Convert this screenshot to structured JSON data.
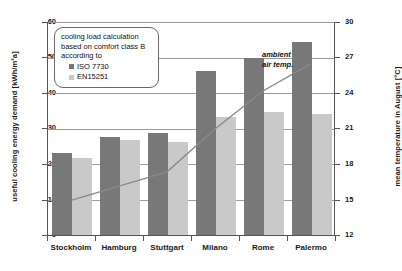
{
  "chart_data": {
    "type": "bar",
    "title": "",
    "categories": [
      "Stockholm",
      "Hamburg",
      "Stuttgart",
      "Milano",
      "Rome",
      "Palermo"
    ],
    "series": [
      {
        "name": "ISO 7730",
        "type": "bar",
        "color": "#787878",
        "axis": "left",
        "values": [
          23.0,
          27.5,
          28.5,
          46.0,
          49.5,
          54.0
        ]
      },
      {
        "name": "EN15251",
        "type": "bar",
        "color": "#c9c9c9",
        "axis": "left",
        "values": [
          21.5,
          26.5,
          26.0,
          33.0,
          34.5,
          34.0
        ]
      },
      {
        "name": "ambient air temp.",
        "type": "line",
        "color": "#8a8a8a",
        "axis": "right",
        "values": [
          15.0,
          16.2,
          17.4,
          21.0,
          24.2,
          26.5
        ]
      }
    ],
    "xlabel": "",
    "ylabel": "useful cooling energy demand [kWh/m²a]",
    "ylabel_right": "mean temperature in August [°C]",
    "ylim": [
      0,
      60
    ],
    "yticks": [
      "0",
      "10",
      "20",
      "30",
      "40",
      "50",
      "60"
    ],
    "ylim_right": [
      12,
      30
    ],
    "yticks_right": [
      "12",
      "15",
      "18",
      "21",
      "24",
      "27",
      "30"
    ],
    "grid": true,
    "legend_position": "upper-left"
  },
  "axes": {
    "left_title": "useful cooling energy demand [kWh/m²a]",
    "right_title": "mean temperature in August [°C]"
  },
  "legend": {
    "heading_line1": "cooling load calculation",
    "heading_line2": "based on comfort class B",
    "heading_line3": "according to",
    "items": [
      {
        "label": "ISO 7730"
      },
      {
        "label": "EN15251"
      }
    ]
  },
  "annotations": {
    "ambient_line1": "ambient",
    "ambient_line2": "air temp."
  },
  "colors": {
    "series1": "#787878",
    "series2": "#c9c9c9",
    "line": "#8a8a8a",
    "grid": "#9a9a9a",
    "axis": "#555555"
  }
}
